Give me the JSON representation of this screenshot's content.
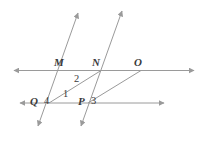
{
  "figure": {
    "kind": "geometry-diagram",
    "width": 206,
    "height": 144,
    "background": "#ffffff",
    "stroke_color": "#9a9a9a",
    "label_color": "#3a3a3a",
    "point_labels": [
      {
        "id": "M",
        "text": "M"
      },
      {
        "id": "N",
        "text": "N"
      },
      {
        "id": "O",
        "text": "O"
      },
      {
        "id": "Q",
        "text": "Q"
      },
      {
        "id": "P",
        "text": "P"
      }
    ],
    "angle_labels": [
      {
        "id": "1",
        "text": "1"
      },
      {
        "id": "2",
        "text": "2"
      },
      {
        "id": "3",
        "text": "3"
      },
      {
        "id": "4",
        "text": "4"
      }
    ],
    "lines": [
      {
        "id": "upper-horizontal-line",
        "type": "double-arrow-line"
      },
      {
        "id": "lower-horizontal-line",
        "type": "double-arrow-line"
      },
      {
        "id": "left-transversal-line",
        "type": "double-arrow-line"
      },
      {
        "id": "right-transversal-line",
        "type": "double-arrow-line"
      },
      {
        "id": "segment-Q-to-N",
        "type": "segment"
      },
      {
        "id": "segment-P-to-O",
        "type": "segment"
      }
    ]
  }
}
